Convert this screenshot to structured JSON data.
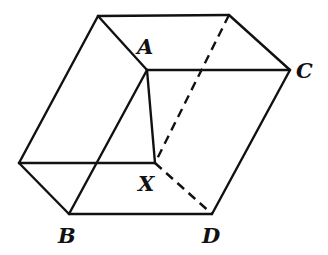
{
  "diagram": {
    "type": "parallelepiped",
    "stroke_color": "#111111",
    "vertices": {
      "TL": [
        98,
        16
      ],
      "TR": [
        229,
        15
      ],
      "A": [
        147,
        70
      ],
      "C": [
        290,
        70
      ],
      "L": [
        19,
        163
      ],
      "X": [
        155,
        163
      ],
      "B": [
        69,
        214
      ],
      "D": [
        212,
        214
      ]
    },
    "labels": [
      {
        "text": "A",
        "x": 137,
        "y": 54
      },
      {
        "text": "C",
        "x": 296,
        "y": 78
      },
      {
        "text": "X",
        "x": 138,
        "y": 191
      },
      {
        "text": "B",
        "x": 58,
        "y": 243
      },
      {
        "text": "D",
        "x": 202,
        "y": 243
      }
    ],
    "solid_edges": [
      [
        "TL",
        "TR"
      ],
      [
        "TL",
        "A"
      ],
      [
        "TR",
        "C"
      ],
      [
        "A",
        "C"
      ],
      [
        "TL",
        "L"
      ],
      [
        "A",
        "B"
      ],
      [
        "A",
        "X"
      ],
      [
        "L",
        "X"
      ],
      [
        "L",
        "B"
      ],
      [
        "B",
        "D"
      ],
      [
        "C",
        "D"
      ]
    ],
    "dashed_edges": [
      [
        "TR",
        "X"
      ],
      [
        "X",
        "D"
      ]
    ]
  }
}
